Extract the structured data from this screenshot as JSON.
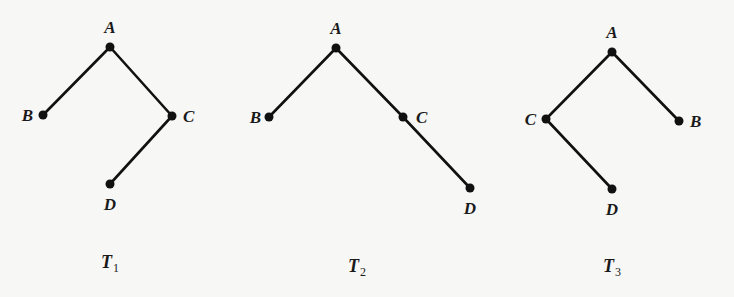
{
  "figure": {
    "trees": [
      {
        "name": "T1",
        "caption": {
          "main": "T",
          "sub": "1"
        },
        "nodes": [
          {
            "id": "A",
            "label": "A",
            "x": 110,
            "y": 47,
            "lx": 110,
            "ly": 33,
            "anchor": "middle"
          },
          {
            "id": "B",
            "label": "B",
            "x": 43,
            "y": 115,
            "lx": 33,
            "ly": 121,
            "anchor": "end"
          },
          {
            "id": "C",
            "label": "C",
            "x": 172,
            "y": 116,
            "lx": 183,
            "ly": 122,
            "anchor": "start"
          },
          {
            "id": "D",
            "label": "D",
            "x": 110,
            "y": 184,
            "lx": 110,
            "ly": 210,
            "anchor": "middle"
          }
        ],
        "edges": [
          [
            "A",
            "B"
          ],
          [
            "A",
            "C"
          ],
          [
            "C",
            "D"
          ]
        ]
      },
      {
        "name": "T2",
        "caption": {
          "main": "T",
          "sub": "2"
        },
        "nodes": [
          {
            "id": "A",
            "label": "A",
            "x": 336,
            "y": 48,
            "lx": 336,
            "ly": 34,
            "anchor": "middle"
          },
          {
            "id": "B",
            "label": "B",
            "x": 269,
            "y": 117,
            "lx": 261,
            "ly": 123,
            "anchor": "end"
          },
          {
            "id": "C",
            "label": "C",
            "x": 403,
            "y": 117,
            "lx": 416,
            "ly": 123,
            "anchor": "start"
          },
          {
            "id": "D",
            "label": "D",
            "x": 470,
            "y": 188,
            "lx": 470,
            "ly": 214,
            "anchor": "middle"
          }
        ],
        "edges": [
          [
            "A",
            "B"
          ],
          [
            "A",
            "C"
          ],
          [
            "C",
            "D"
          ]
        ]
      },
      {
        "name": "T3",
        "caption": {
          "main": "T",
          "sub": "3"
        },
        "nodes": [
          {
            "id": "A",
            "label": "A",
            "x": 612,
            "y": 52,
            "lx": 612,
            "ly": 38,
            "anchor": "middle"
          },
          {
            "id": "C",
            "label": "C",
            "x": 546,
            "y": 119,
            "lx": 536,
            "ly": 125,
            "anchor": "end"
          },
          {
            "id": "B",
            "label": "B",
            "x": 679,
            "y": 121,
            "lx": 690,
            "ly": 127,
            "anchor": "start"
          },
          {
            "id": "D",
            "label": "D",
            "x": 612,
            "y": 189,
            "lx": 612,
            "ly": 215,
            "anchor": "middle"
          }
        ],
        "edges": [
          [
            "A",
            "C"
          ],
          [
            "A",
            "B"
          ],
          [
            "C",
            "D"
          ]
        ]
      }
    ],
    "captions_pos": [
      {
        "x": 110,
        "y": 268
      },
      {
        "x": 357,
        "y": 272
      },
      {
        "x": 612,
        "y": 272
      }
    ]
  }
}
